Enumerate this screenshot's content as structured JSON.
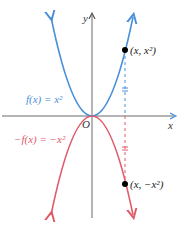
{
  "diagram": {
    "axes": {
      "x_label": "x",
      "y_label": "y",
      "origin_label": "O",
      "axis_color": "#6a6a6a"
    },
    "curves": [
      {
        "name": "f",
        "equation_label": "f(x) = x²",
        "color": "#4a90d9"
      },
      {
        "name": "neg-f",
        "equation_label": "−f(x) = −x²",
        "color": "#e05a6a"
      }
    ],
    "points": [
      {
        "label": "(x, x²)",
        "color": "#000000"
      },
      {
        "label": "(x, −x²)",
        "color": "#000000"
      }
    ],
    "guide": {
      "style": "dashed",
      "upper_color": "#4a90d9",
      "lower_color": "#e05a6a",
      "tick_marks": "equal-length marks"
    }
  }
}
